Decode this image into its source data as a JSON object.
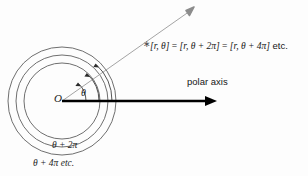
{
  "figure": {
    "name": "polar-coordinates-multiple-representations",
    "type": "diagram",
    "background_color": "#fdfdfd",
    "ink_color": "#1b1b1b",
    "ray_color": "#8c8c8c",
    "axis_color": "#000000",
    "circle_color": "#5f5f5f"
  },
  "geometry": {
    "origin": {
      "x": 62,
      "y": 101
    },
    "circles": [
      {
        "label": "inner-circle",
        "radius": 38
      },
      {
        "label": "middle-circle",
        "radius": 46
      },
      {
        "label": "outer-circle",
        "radius": 54
      }
    ],
    "polar_axis": {
      "x1": 62,
      "y1": 101,
      "x2": 217,
      "y2": 101
    },
    "ray": {
      "x1": 62,
      "y1": 101,
      "x2": 194,
      "y2": 8
    },
    "angle_arcs": [
      {
        "label": "theta-arc-1",
        "radius": 24
      },
      {
        "label": "theta-arc-2",
        "radius": 37
      },
      {
        "label": "theta-arc-3",
        "radius": 50
      }
    ]
  },
  "labels": {
    "origin": "O",
    "theta": "θ",
    "polar_axis": "polar axis",
    "theta_plus_2pi": "θ + 2π",
    "theta_plus_4pi": "θ + 4π etc.",
    "equation": {
      "full": "[r, θ] = [r, θ + 2π] = [r, θ + 4π] etc.",
      "part_1": "[r, θ]",
      "eq_1": " = ",
      "part_2": "[r, θ + 2π]",
      "eq_2": " = ",
      "part_3": "[r, θ + 4π]",
      "suffix": " etc."
    }
  }
}
